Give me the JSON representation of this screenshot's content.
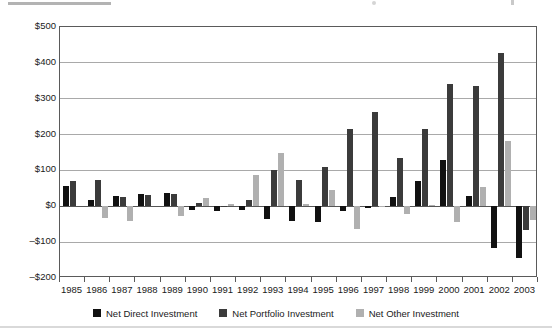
{
  "figure": {
    "top_rule_visible": true,
    "bottom_rule_visible": true
  },
  "chart_data": {
    "type": "bar",
    "title": "",
    "subtitle": "",
    "xlabel": "",
    "ylabel": "",
    "grid": true,
    "legend_position": "bottom",
    "ylim": [
      -200,
      500
    ],
    "yticks": [
      500,
      400,
      300,
      200,
      100,
      0,
      -100,
      -200
    ],
    "ytick_labels": [
      "$500",
      "$400",
      "$300",
      "$200",
      "$100",
      "$0",
      "–$100",
      "–$200"
    ],
    "categories": [
      "1985",
      "1986",
      "1987",
      "1988",
      "1989",
      "1990",
      "1991",
      "1992",
      "1993",
      "1994",
      "1995",
      "1996",
      "1997",
      "1998",
      "1999",
      "2000",
      "2001",
      "2002",
      "2003"
    ],
    "series": [
      {
        "name": "Net Direct Investment",
        "color": "#111111",
        "values": [
          57,
          18,
          29,
          35,
          37,
          -9,
          -12,
          -11,
          -35,
          -40,
          -45,
          -12,
          -5,
          27,
          70,
          130,
          30,
          -115,
          -145
        ]
      },
      {
        "name": "Net Portfolio Investment",
        "color": "#3b3b3b",
        "values": [
          70,
          72,
          26,
          32,
          35,
          8,
          -3,
          18,
          100,
          72,
          110,
          215,
          262,
          135,
          215,
          340,
          335,
          428,
          -65
        ]
      },
      {
        "name": "Net Other Investment",
        "color": "#b0b0b0",
        "values": [
          0,
          -32,
          -40,
          0,
          -28,
          22,
          5,
          88,
          148,
          5,
          45,
          -62,
          -2,
          -22,
          3,
          -43,
          55,
          183,
          -38
        ]
      }
    ]
  },
  "legend": {
    "items": [
      {
        "label": "Net Direct Investment",
        "swatch": "legend-swatch-direct"
      },
      {
        "label": "Net Portfolio Investment",
        "swatch": "legend-swatch-portfolio"
      },
      {
        "label": "Net Other Investment",
        "swatch": "legend-swatch-other"
      }
    ]
  }
}
